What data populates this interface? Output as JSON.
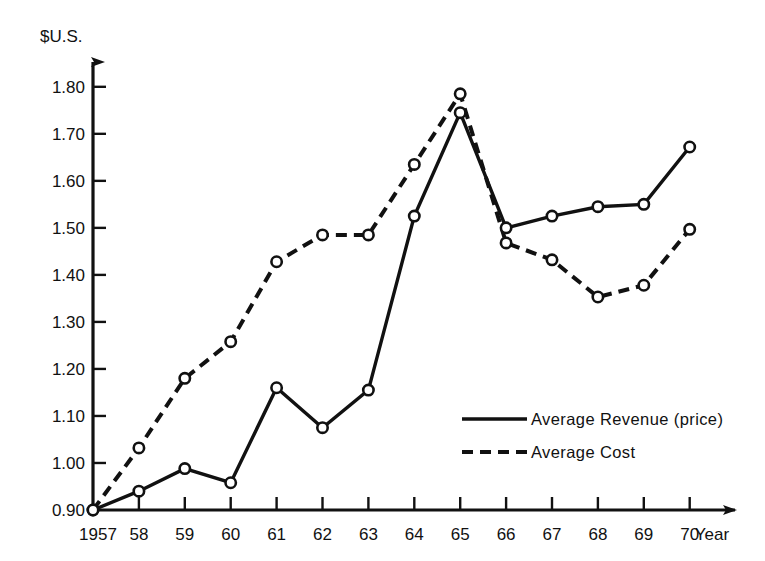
{
  "chart_data": {
    "type": "line",
    "title": "",
    "subtitle": "",
    "xlabel": "Year",
    "ylabel": "$U.S.",
    "x": [
      1957,
      1958,
      1959,
      1960,
      1961,
      1962,
      1963,
      1964,
      1965,
      1966,
      1967,
      1968,
      1969,
      1970
    ],
    "categories": [
      "1957",
      "58",
      "59",
      "60",
      "61",
      "62",
      "63",
      "64",
      "65",
      "66",
      "67",
      "68",
      "69",
      "70"
    ],
    "series": [
      {
        "name": "Average Revenue (price)",
        "style": "solid",
        "marker": "open-circle",
        "color": "#111111",
        "values": [
          0.9,
          0.94,
          0.988,
          0.958,
          1.16,
          1.075,
          1.155,
          1.525,
          1.745,
          1.5,
          1.525,
          1.545,
          1.55,
          1.672
        ]
      },
      {
        "name": "Average Cost",
        "style": "dashed",
        "marker": "open-circle",
        "color": "#111111",
        "values": [
          0.9,
          1.032,
          1.18,
          1.258,
          1.428,
          1.485,
          1.485,
          1.635,
          1.785,
          1.468,
          1.432,
          1.353,
          1.378,
          1.497
        ]
      }
    ],
    "ylim": [
      0.9,
      1.84
    ],
    "yticks": [
      0.9,
      1.0,
      1.1,
      1.2,
      1.3,
      1.4,
      1.5,
      1.6,
      1.7,
      1.8
    ],
    "ytick_labels": [
      "0.90",
      "1.00",
      "1.10",
      "1.20",
      "1.30",
      "1.40",
      "1.50",
      "1.60",
      "1.70",
      "1.80"
    ],
    "xlim": [
      1957,
      1970.9
    ],
    "grid": false,
    "legend_position": "center-right",
    "legend": [
      {
        "label": "Average Revenue (price)",
        "style": "solid"
      },
      {
        "label": "Average Cost",
        "style": "dashed"
      }
    ]
  },
  "axes": {
    "y_axis_title": "$U.S.",
    "x_axis_title": "Year"
  }
}
